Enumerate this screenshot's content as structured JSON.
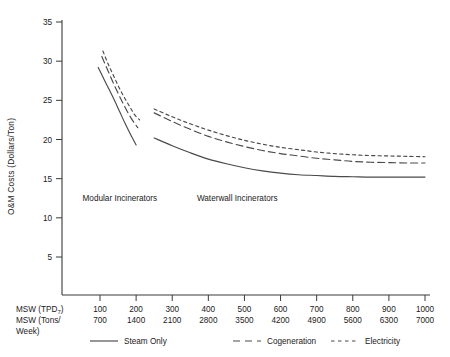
{
  "chart_data": {
    "type": "line",
    "title": "",
    "xlabel": "MSW (TPD7) / MSW (Tons/Week)",
    "ylabel": "O&M Costs (Dollars/Ton)",
    "ylim": [
      0,
      35
    ],
    "yticks": [
      5,
      10,
      15,
      20,
      25,
      30,
      35
    ],
    "xlim": [
      50,
      1050
    ],
    "grid": false,
    "legend_position": "bottom",
    "axis_names": {
      "primary": "MSW (TPD",
      "primary_sub": "7",
      "primary_close": ")",
      "secondary_line1": "MSW (Tons/",
      "secondary_line2": "Week)"
    },
    "x_tick_labels_tpd": [
      "100",
      "200",
      "300",
      "400",
      "500",
      "600",
      "700",
      "800",
      "900",
      "1000"
    ],
    "x_tick_labels_tons_week": [
      "700",
      "1400",
      "2100",
      "2800",
      "3500",
      "4200",
      "4900",
      "5600",
      "6300",
      "7000"
    ],
    "x_tick_values": [
      100,
      200,
      300,
      400,
      500,
      600,
      700,
      800,
      900,
      1000
    ],
    "annotations": [
      {
        "text": "Modular Incinerators",
        "x": 155,
        "y": 12.2
      },
      {
        "text": "Waterwall Incinerators",
        "x": 480,
        "y": 12.2
      }
    ],
    "series": [
      {
        "name": "Steam Only",
        "style": "solid",
        "group": "Modular Incinerators",
        "x": [
          95,
          110,
          125,
          140,
          155,
          170,
          185,
          200
        ],
        "values": [
          29.2,
          27.8,
          26.4,
          25.0,
          23.5,
          22.0,
          20.6,
          19.3
        ]
      },
      {
        "name": "Cogeneration",
        "style": "long-dash",
        "group": "Modular Incinerators",
        "x": [
          105,
          120,
          135,
          150,
          165,
          180,
          195,
          205
        ],
        "values": [
          30.6,
          29.0,
          27.4,
          25.9,
          24.5,
          23.2,
          22.1,
          21.5
        ]
      },
      {
        "name": "Electricity",
        "style": "short-dash",
        "group": "Modular Incinerators",
        "x": [
          108,
          122,
          137,
          152,
          167,
          182,
          197,
          210
        ],
        "values": [
          31.3,
          29.7,
          28.2,
          26.7,
          25.4,
          24.2,
          23.1,
          22.5
        ]
      },
      {
        "name": "Steam Only",
        "style": "solid",
        "group": "Waterwall Incinerators",
        "x": [
          250,
          300,
          350,
          400,
          450,
          500,
          550,
          600,
          650,
          700,
          750,
          800,
          850,
          900,
          950,
          1000
        ],
        "values": [
          20.2,
          19.2,
          18.3,
          17.5,
          16.9,
          16.4,
          16.0,
          15.7,
          15.5,
          15.4,
          15.3,
          15.25,
          15.2,
          15.2,
          15.2,
          15.2
        ]
      },
      {
        "name": "Cogeneration",
        "style": "long-dash",
        "group": "Waterwall Incinerators",
        "x": [
          250,
          300,
          350,
          400,
          450,
          500,
          550,
          600,
          650,
          700,
          750,
          800,
          850,
          900,
          950,
          1000
        ],
        "values": [
          23.4,
          22.3,
          21.3,
          20.4,
          19.7,
          19.1,
          18.6,
          18.2,
          17.9,
          17.6,
          17.4,
          17.2,
          17.1,
          17.05,
          17.0,
          17.0
        ]
      },
      {
        "name": "Electricity",
        "style": "short-dash",
        "group": "Waterwall Incinerators",
        "x": [
          250,
          300,
          350,
          400,
          450,
          500,
          550,
          600,
          650,
          700,
          750,
          800,
          850,
          900,
          950,
          1000
        ],
        "values": [
          23.9,
          22.9,
          22.0,
          21.2,
          20.5,
          19.9,
          19.4,
          19.0,
          18.7,
          18.4,
          18.2,
          18.05,
          17.95,
          17.9,
          17.85,
          17.8
        ]
      }
    ],
    "legend": [
      {
        "label": "Steam Only",
        "style": "solid"
      },
      {
        "label": "Cogeneration",
        "style": "long-dash"
      },
      {
        "label": "Electricity",
        "style": "short-dash"
      }
    ]
  }
}
